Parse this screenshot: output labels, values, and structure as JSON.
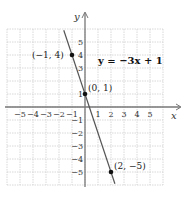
{
  "chart_data": {
    "type": "line",
    "title": "",
    "equation_label": "y = −3x + 1",
    "xlabel": "x",
    "ylabel": "y",
    "xlim": [
      -6,
      6
    ],
    "ylim": [
      -6,
      6
    ],
    "grid": true,
    "x_tick_labels": [
      "−5",
      "−4",
      "−3",
      "−2",
      "−1",
      "1",
      "2",
      "3",
      "4",
      "5"
    ],
    "x_ticks": [
      -5,
      -4,
      -3,
      -2,
      -1,
      1,
      2,
      3,
      4,
      5
    ],
    "y_tick_labels": [
      "5",
      "4",
      "3",
      "1",
      "−1",
      "−2",
      "−3",
      "−4",
      "−5"
    ],
    "y_ticks": [
      5,
      4,
      3,
      1,
      -1,
      -2,
      -3,
      -4,
      -5
    ],
    "line": {
      "slope": -3,
      "intercept": 1,
      "color": "#555555"
    },
    "points": [
      {
        "x": -1,
        "y": 4,
        "label": "(−1, 4)"
      },
      {
        "x": 0,
        "y": 1,
        "label": "(0, 1)"
      },
      {
        "x": 2,
        "y": -5,
        "label": "(2, −5)"
      }
    ],
    "colors": {
      "grid": "#cfcfcf",
      "axis": "#777777",
      "line": "#555555",
      "point": "#111111"
    }
  }
}
